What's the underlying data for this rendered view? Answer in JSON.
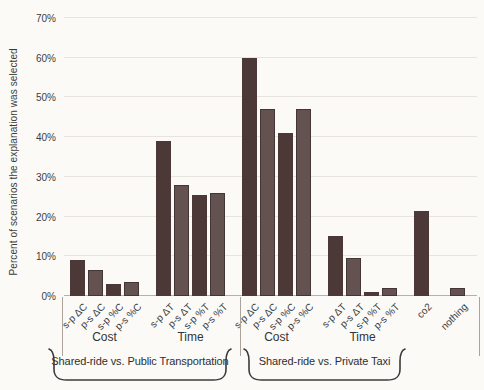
{
  "chart_data": {
    "type": "bar",
    "title": "",
    "ylabel": "Percent of scenarios the explanation was selected",
    "xlabel": "",
    "ylim": [
      0,
      70
    ],
    "grid": "horizontal",
    "ytick_labels": [
      "0%",
      "10%",
      "20%",
      "30%",
      "40%",
      "50%",
      "60%",
      "70%"
    ],
    "series_colors": {
      "s-p": "#4b3837",
      "p-s": "#645251"
    },
    "groups": [
      {
        "label": "Shared-ride vs. Public Transportation",
        "clusters": [
          {
            "label": "Cost",
            "bars": [
              {
                "label": "s-p ΔC",
                "series": "s-p",
                "value": 9
              },
              {
                "label": "p-s ΔC",
                "series": "p-s",
                "value": 6.5
              },
              {
                "label": "s-p %C",
                "series": "s-p",
                "value": 3
              },
              {
                "label": "p-s %C",
                "series": "p-s",
                "value": 3.5
              }
            ]
          },
          {
            "label": "Time",
            "bars": [
              {
                "label": "s-p ΔT",
                "series": "s-p",
                "value": 39
              },
              {
                "label": "p-s ΔT",
                "series": "p-s",
                "value": 28
              },
              {
                "label": "s-p %T",
                "series": "s-p",
                "value": 25.5
              },
              {
                "label": "p-s %T",
                "series": "p-s",
                "value": 26
              }
            ]
          }
        ]
      },
      {
        "label": "Shared-ride vs. Private Taxi",
        "clusters": [
          {
            "label": "Cost",
            "bars": [
              {
                "label": "s-p ΔC",
                "series": "s-p",
                "value": 60
              },
              {
                "label": "p-s ΔC",
                "series": "p-s",
                "value": 47
              },
              {
                "label": "s-p %C",
                "series": "s-p",
                "value": 41
              },
              {
                "label": "p-s %C",
                "series": "p-s",
                "value": 47
              }
            ]
          },
          {
            "label": "Time",
            "bars": [
              {
                "label": "s-p ΔT",
                "series": "s-p",
                "value": 15
              },
              {
                "label": "p-s ΔT",
                "series": "p-s",
                "value": 9.5
              },
              {
                "label": "s-p %T",
                "series": "s-p",
                "value": 1
              },
              {
                "label": "p-s %T",
                "series": "p-s",
                "value": 2
              }
            ]
          }
        ]
      }
    ],
    "standalone_bars": [
      {
        "label": "co2",
        "series": "s-p",
        "value": 21.5
      },
      {
        "label": "nothing",
        "series": "p-s",
        "value": 2
      }
    ]
  }
}
